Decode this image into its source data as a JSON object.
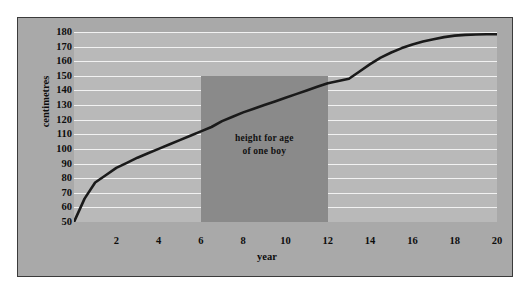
{
  "figure": {
    "panel_bg": "#a9a9a9",
    "plot_bg": "#b9b9b9",
    "grid_color": "#f2f2f2",
    "border_color": "#3b3b3b",
    "curve_color": "#1a1a1a",
    "highlight_color": "#8a8a8a"
  },
  "chart_data": {
    "type": "line",
    "title": "",
    "subtitle": "",
    "xlabel": "year",
    "ylabel": "centimetres",
    "xlim": [
      0,
      20
    ],
    "ylim": [
      50,
      180
    ],
    "grid": true,
    "grid_axis": "y",
    "legend": "none",
    "y_ticks": [
      180,
      170,
      160,
      150,
      140,
      130,
      120,
      110,
      100,
      90,
      80,
      70,
      60,
      50
    ],
    "x_ticks": [
      2,
      4,
      6,
      8,
      10,
      12,
      14,
      16,
      18,
      20
    ],
    "series": [
      {
        "name": "height for age of one boy",
        "color": "#1a1a1a",
        "x": [
          0,
          0.5,
          1,
          1.5,
          2,
          2.5,
          3,
          3.5,
          4,
          4.5,
          5,
          5.5,
          6,
          6.5,
          7,
          7.5,
          8,
          8.5,
          9,
          9.5,
          10,
          10.5,
          11,
          11.5,
          12,
          12.5,
          13,
          13.5,
          14,
          14.5,
          15,
          15.5,
          16,
          16.5,
          17,
          17.5,
          18,
          18.5,
          19,
          19.5,
          20
        ],
        "y": [
          50,
          66,
          77,
          82,
          87,
          90.5,
          94,
          97,
          100,
          103,
          106,
          109,
          112,
          115,
          119,
          122,
          125,
          127.5,
          130,
          132.5,
          135,
          137.5,
          140,
          142.5,
          145,
          146.5,
          148,
          153,
          158,
          162.5,
          166,
          169,
          171.5,
          173.5,
          175,
          176.5,
          177.5,
          178,
          178.3,
          178.5,
          178.5
        ]
      }
    ],
    "annotations": [
      {
        "name": "height-for-age-region",
        "type": "shaded-rect",
        "x_start": 6,
        "x_end": 12,
        "y_start": 50,
        "y_end": 150,
        "color": "#8a8a8a",
        "label_line1": "height  for  age",
        "label_line2": "of one boy",
        "label_x": 9,
        "label_y": 103
      }
    ]
  }
}
